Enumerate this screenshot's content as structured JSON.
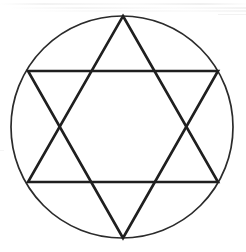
{
  "figure": {
    "canvas": {
      "width": 246,
      "height": 252,
      "background": "#ffffff"
    },
    "colors": {
      "background": "#ffffff",
      "circle_stroke": "#2b2b2b",
      "star_stroke": "#1f1f1f",
      "streak": "#f2f2f2"
    },
    "circle": {
      "label": "circumscribed-circle",
      "center_x": 122,
      "center_y": 127,
      "radius": 111,
      "stroke_width": 1.7,
      "fill": "none"
    },
    "hexagram": {
      "label": "hexagram",
      "stroke_width": 2.6,
      "fill": "none",
      "vertices": [
        {
          "name": "top",
          "x": 123,
          "y": 16
        },
        {
          "name": "upper-right",
          "x": 218,
          "y": 71
        },
        {
          "name": "lower-right",
          "x": 218,
          "y": 182
        },
        {
          "name": "bottom",
          "x": 123,
          "y": 238
        },
        {
          "name": "lower-left",
          "x": 28,
          "y": 182
        },
        {
          "name": "upper-left",
          "x": 28,
          "y": 71
        }
      ],
      "triangles": [
        {
          "name": "upward-triangle",
          "points": "123,16 218,182 28,182"
        },
        {
          "name": "downward-triangle",
          "points": "123,238 28,71 218,71"
        }
      ],
      "inner_hexagon_fill": "none"
    },
    "scan_artifacts": [
      {
        "name": "streak-a",
        "x": 0,
        "y": 3,
        "width": 246,
        "height": 2
      },
      {
        "name": "streak-b",
        "x": 10,
        "y": 7,
        "width": 236,
        "height": 2
      },
      {
        "name": "streak-c",
        "x": 24,
        "y": 10,
        "width": 222,
        "height": 2
      },
      {
        "name": "streak-d",
        "x": 218,
        "y": 14,
        "width": 28,
        "height": 1
      },
      {
        "name": "streak-e",
        "x": 0,
        "y": 150,
        "width": 4,
        "height": 1
      }
    ]
  }
}
